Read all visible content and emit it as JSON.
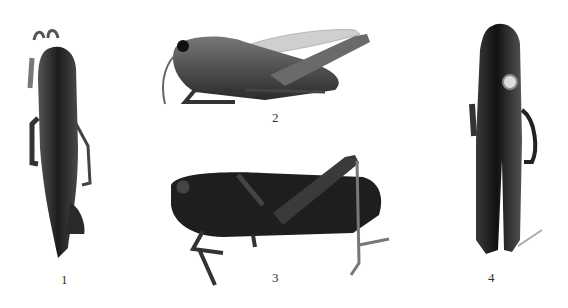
{
  "figure": {
    "background": "#ffffff",
    "specimens": [
      {
        "label": "1",
        "view": "dorsal"
      },
      {
        "label": "2",
        "view": "lateral"
      },
      {
        "label": "3",
        "view": "lateral"
      },
      {
        "label": "4",
        "view": "ventral"
      }
    ]
  }
}
